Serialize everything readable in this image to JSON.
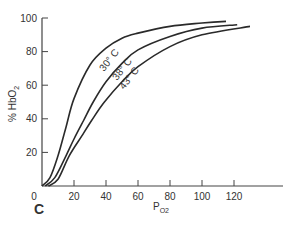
{
  "chart_data": {
    "type": "line",
    "title": "",
    "panel_label": "C",
    "xlabel": "PO2",
    "xlabel_main": "P",
    "xlabel_sub": "O2",
    "ylabel": "% HbO2",
    "ylabel_main": "% HbO",
    "ylabel_sub": "2",
    "xlim": [
      0,
      150
    ],
    "ylim": [
      0,
      100
    ],
    "x_ticks": [
      0,
      20,
      40,
      60,
      80,
      100,
      120
    ],
    "y_ticks": [
      20,
      40,
      60,
      80,
      100
    ],
    "grid": false,
    "legend": "inline curve labels",
    "series": [
      {
        "name": "30° C",
        "label": "30° C",
        "points": [
          [
            0,
            0
          ],
          [
            5,
            5
          ],
          [
            10,
            18
          ],
          [
            15,
            35
          ],
          [
            20,
            52
          ],
          [
            30,
            72
          ],
          [
            40,
            82
          ],
          [
            50,
            88
          ],
          [
            60,
            91
          ],
          [
            80,
            95
          ],
          [
            100,
            97
          ],
          [
            115,
            98
          ]
        ]
      },
      {
        "name": "38° C",
        "label": "38° C",
        "points": [
          [
            2,
            0
          ],
          [
            8,
            5
          ],
          [
            15,
            18
          ],
          [
            20,
            28
          ],
          [
            26,
            39
          ],
          [
            32,
            50
          ],
          [
            40,
            62
          ],
          [
            50,
            73
          ],
          [
            60,
            81
          ],
          [
            80,
            89
          ],
          [
            100,
            94
          ],
          [
            122,
            96
          ]
        ]
      },
      {
        "name": "43° C",
        "label": "43° C",
        "points": [
          [
            4,
            0
          ],
          [
            10,
            4
          ],
          [
            17,
            18
          ],
          [
            25,
            30
          ],
          [
            31,
            39
          ],
          [
            39,
            50
          ],
          [
            50,
            62
          ],
          [
            60,
            71
          ],
          [
            80,
            83
          ],
          [
            100,
            90
          ],
          [
            130,
            95
          ]
        ]
      }
    ]
  },
  "colors": {
    "line": "#2a2a2a",
    "axis": "#444444",
    "text": "#333333"
  }
}
